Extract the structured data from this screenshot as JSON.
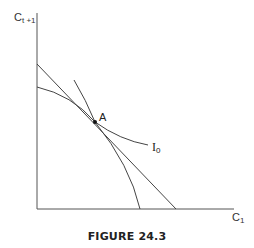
{
  "figure": {
    "caption": "FIGURE 24.3",
    "y_axis": {
      "label": "C",
      "subscript": "t +1"
    },
    "x_axis": {
      "label": "C",
      "subscript": "1"
    },
    "point": {
      "label": "A"
    },
    "indifference_curve": {
      "label": "I",
      "subscript": "0"
    },
    "colors": {
      "line": "#444444",
      "point": "#111111",
      "text": "#222222"
    }
  }
}
